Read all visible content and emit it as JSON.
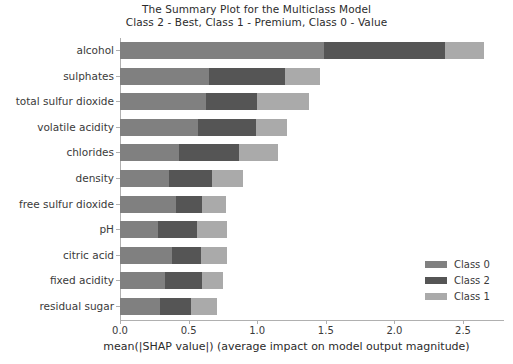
{
  "chart_data": {
    "type": "bar",
    "orientation": "horizontal",
    "stacked": true,
    "title": "The Summary Plot for the Multiclass Model",
    "subtitle": "Class 2 - Best, Class 1 - Premium, Class 0 - Value",
    "xlabel": "mean(|SHAP value|) (average impact on model output magnitude)",
    "ylabel": "",
    "xlim": [
      0.0,
      2.8
    ],
    "ylim_categories": 11,
    "grid": false,
    "legend_position": "lower right",
    "xticks": [
      "0.0",
      "0.5",
      "1.0",
      "1.5",
      "2.0",
      "2.5"
    ],
    "xtick_values": [
      0.0,
      0.5,
      1.0,
      1.5,
      2.0,
      2.5
    ],
    "categories": [
      "alcohol",
      "sulphates",
      "total sulfur dioxide",
      "volatile acidity",
      "chlorides",
      "density",
      "free sulfur dioxide",
      "pH",
      "citric acid",
      "fixed acidity",
      "residual sugar"
    ],
    "series": [
      {
        "name": "Class 0",
        "color": "#808080",
        "values": [
          1.49,
          0.65,
          0.63,
          0.57,
          0.43,
          0.36,
          0.41,
          0.28,
          0.38,
          0.33,
          0.29
        ]
      },
      {
        "name": "Class 2",
        "color": "#555555",
        "values": [
          0.88,
          0.55,
          0.37,
          0.42,
          0.44,
          0.31,
          0.19,
          0.28,
          0.21,
          0.27,
          0.23
        ]
      },
      {
        "name": "Class 1",
        "color": "#aaaaaa",
        "values": [
          0.28,
          0.26,
          0.38,
          0.23,
          0.28,
          0.23,
          0.17,
          0.22,
          0.19,
          0.15,
          0.19
        ]
      }
    ],
    "totals": [
      2.65,
      1.46,
      1.38,
      1.22,
      1.15,
      0.9,
      0.77,
      0.78,
      0.78,
      0.75,
      0.71
    ]
  },
  "legend": {
    "entries": [
      {
        "label": "Class 0",
        "color": "#808080"
      },
      {
        "label": "Class 2",
        "color": "#555555"
      },
      {
        "label": "Class 1",
        "color": "#aaaaaa"
      }
    ]
  }
}
